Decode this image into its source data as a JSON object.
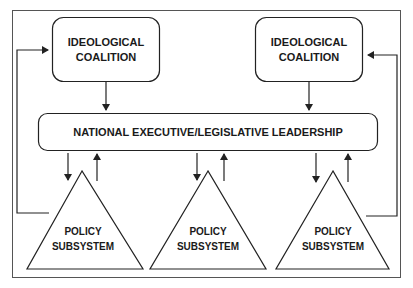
{
  "diagram": {
    "nodes": {
      "coalition_left": {
        "line1": "IDEOLOGICAL",
        "line2": "COALITION"
      },
      "coalition_right": {
        "line1": "IDEOLOGICAL",
        "line2": "COALITION"
      },
      "leadership": {
        "label": "NATIONAL EXECUTIVE/LEGISLATIVE LEADERSHIP"
      },
      "subsystems": [
        {
          "line1": "POLICY",
          "line2": "SUBSYSTEM"
        },
        {
          "line1": "POLICY",
          "line2": "SUBSYSTEM"
        },
        {
          "line1": "POLICY",
          "line2": "SUBSYSTEM"
        }
      ]
    },
    "edges": [
      {
        "from": "coalition_left",
        "to": "leadership"
      },
      {
        "from": "coalition_right",
        "to": "leadership"
      },
      {
        "from": "leadership",
        "to": "subsystem_1"
      },
      {
        "from": "subsystem_1",
        "to": "leadership"
      },
      {
        "from": "leadership",
        "to": "subsystem_2"
      },
      {
        "from": "subsystem_2",
        "to": "leadership"
      },
      {
        "from": "leadership",
        "to": "subsystem_3"
      },
      {
        "from": "subsystem_3",
        "to": "leadership"
      },
      {
        "from": "subsystem_1",
        "to": "coalition_left"
      },
      {
        "from": "subsystem_3",
        "to": "coalition_right"
      }
    ],
    "colors": {
      "stroke": "#222222",
      "text": "#1a1a1a",
      "background": "#ffffff"
    }
  }
}
